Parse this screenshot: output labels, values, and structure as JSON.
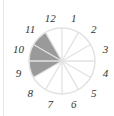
{
  "diagram": {
    "type": "clock-fraction-circle",
    "sectors_total": 12,
    "shaded_sectors": [
      9,
      10,
      11
    ],
    "labels": [
      "12",
      "1",
      "2",
      "3",
      "4",
      "5",
      "6",
      "7",
      "8",
      "9",
      "10",
      "11"
    ],
    "colors": {
      "shade": "#9a9a9a",
      "lines": "#e2e2e2",
      "text": "#333333"
    }
  }
}
